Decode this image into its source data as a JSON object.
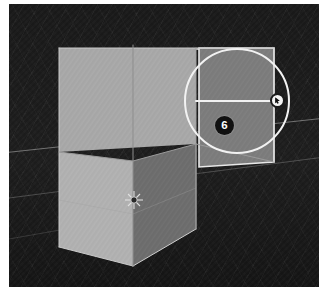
{
  "app": {
    "type": "3d-modeling-viewport",
    "scene_description": "3D viewport showing a grey cube with an extruded rectangular face, dark background with faint floor grid"
  },
  "viewport": {
    "background_color": "#1a1a1a",
    "grid_color": "#d7d7d7",
    "object": {
      "name": "cube-with-extrusion",
      "faces": [
        {
          "name": "front-upper-face",
          "color": "#a7a7a7"
        },
        {
          "name": "front-lower-face",
          "color": "#b0b0b0"
        },
        {
          "name": "side-right-face",
          "color": "#6f6f6f"
        },
        {
          "name": "extruded-face",
          "color": "#7c7c7c"
        },
        {
          "name": "extrusion-top-face",
          "color": "#9d9d9d"
        }
      ],
      "edge_color": "#8a8a8a",
      "origin_widget": "3d-cursor"
    }
  },
  "annotation": {
    "step_number": "6",
    "circle": {
      "center_x": 228,
      "center_y": 97,
      "radius": 53,
      "color": "#f2f2f2"
    },
    "pointer": {
      "label": "click-target",
      "x": 268,
      "y": 97
    },
    "badge": {
      "x": 215,
      "y": 122,
      "background_color": "#111111",
      "text_color": "#ffffff"
    },
    "leader_line": {
      "from_x": 185,
      "from_y": 97,
      "to_x": 263,
      "to_y": 97,
      "color": "#f2f2f2"
    }
  }
}
